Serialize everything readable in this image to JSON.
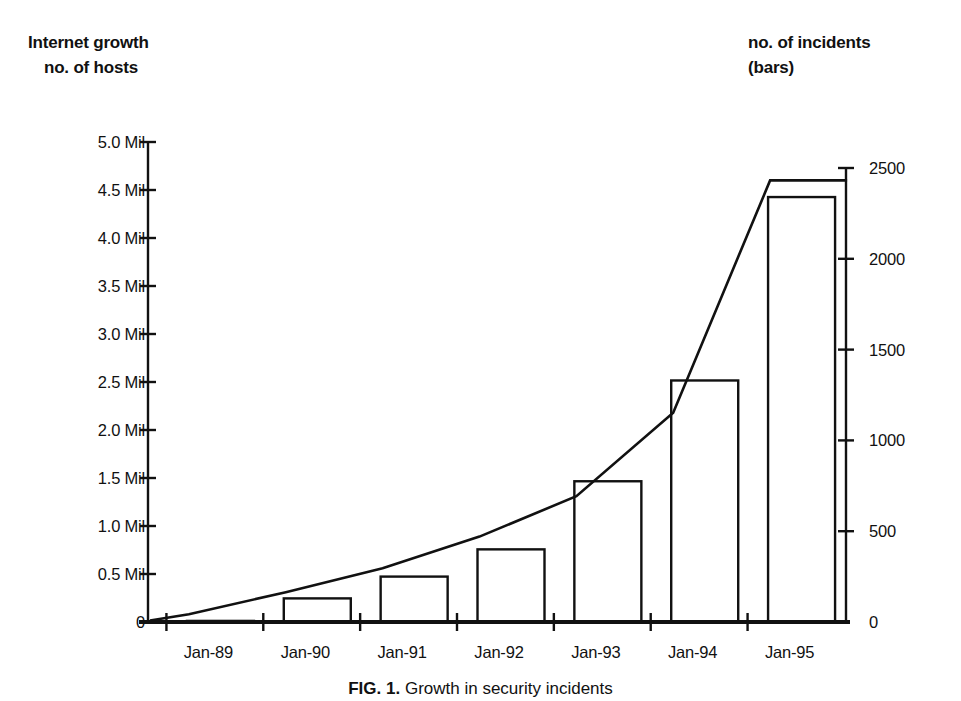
{
  "titles": {
    "left_line1": "Internet growth",
    "left_line2": "no. of hosts",
    "right_line1": "no. of incidents",
    "right_line2": "(bars)"
  },
  "caption": {
    "figure_label": "FIG. 1.",
    "text": "Growth in security incidents"
  },
  "colors": {
    "ink": "#111111",
    "background": "#ffffff",
    "bar_fill": "#ffffff",
    "bar_stroke": "#111111",
    "line_stroke": "#111111"
  },
  "chart_data": {
    "type": "bar",
    "xlabel": "",
    "ylabel": "no. of hosts",
    "categories": [
      "Jan-89",
      "Jan-90",
      "Jan-91",
      "Jan-92",
      "Jan-93",
      "Jan-94",
      "Jan-95"
    ],
    "grid": false,
    "legend": "none",
    "axes": {
      "left": {
        "label": "Internet growth no. of hosts",
        "ylim": [
          0,
          5000000
        ],
        "ticks": [
          0,
          500000,
          1000000,
          1500000,
          2000000,
          2500000,
          3000000,
          3500000,
          4000000,
          4500000,
          5000000
        ],
        "tick_labels": [
          "0",
          "0.5 Mil",
          "1.0 Mil",
          "1.5 Mil",
          "2.0 Mil",
          "2.5 Mil",
          "3.0 Mil",
          "3.5 Mil",
          "4.0 Mil",
          "4.5 Mil",
          "5.0 Mil"
        ]
      },
      "right": {
        "label": "no. of incidents (bars)",
        "ylim": [
          0,
          2500
        ],
        "ticks": [
          0,
          500,
          1000,
          1500,
          2000,
          2500
        ],
        "tick_labels": [
          "0",
          "500",
          "1000",
          "1500",
          "2000",
          "2500"
        ]
      }
    },
    "series": [
      {
        "name": "no. of incidents",
        "render": "bar",
        "axis": "right",
        "values": [
          6,
          130,
          250,
          400,
          775,
          1330,
          2340
        ]
      },
      {
        "name": "Internet growth no. of hosts",
        "render": "line",
        "axis": "left",
        "values": [
          80000,
          310000,
          560000,
          890000,
          1310000,
          2180000,
          4600000
        ]
      }
    ]
  }
}
